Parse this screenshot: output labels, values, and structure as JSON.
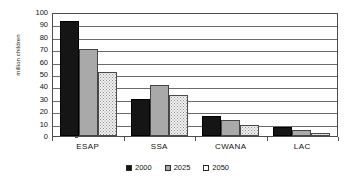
{
  "chart_data": {
    "type": "bar",
    "title": "",
    "subtitle": "",
    "xlabel": "",
    "ylabel": "million children",
    "ylim": [
      0,
      100
    ],
    "y_ticks": [
      0,
      10,
      20,
      30,
      40,
      50,
      60,
      70,
      80,
      90,
      100
    ],
    "grid": true,
    "legend_position": "bottom",
    "categories": [
      "ESAP",
      "SSA",
      "CWANA",
      "LAC"
    ],
    "series": [
      {
        "name": "2000",
        "color": "#151515",
        "values": [
          93,
          30,
          16,
          7
        ]
      },
      {
        "name": "2025",
        "color": "#a9a9a9",
        "values": [
          70,
          41,
          13,
          5
        ]
      },
      {
        "name": "2050",
        "color": "#f2f2f2",
        "values": [
          51.5,
          33,
          8.5,
          2.5
        ]
      }
    ]
  },
  "axis": {
    "y_title": "million children",
    "y_tick_labels": [
      "100",
      "90",
      "80",
      "70",
      "60",
      "50",
      "40",
      "30",
      "20",
      "10",
      "0"
    ],
    "x_tick_labels": [
      "ESAP",
      "SSA",
      "CWANA",
      "LAC"
    ]
  },
  "legend": {
    "items": [
      {
        "label": "2000"
      },
      {
        "label": "2025"
      },
      {
        "label": "2050"
      }
    ]
  }
}
